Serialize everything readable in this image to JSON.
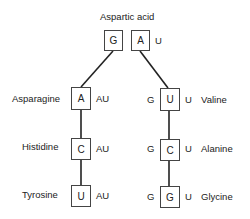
{
  "title": "Aspartic acid",
  "root": {
    "boxes": [
      "G",
      "A"
    ],
    "suffix": "U"
  },
  "left_branch": [
    {
      "name": "Asparagine",
      "box": "A",
      "suffix": "AU"
    },
    {
      "name": "Histidine",
      "box": "C",
      "suffix": "AU"
    },
    {
      "name": "Tyrosine",
      "box": "U",
      "suffix": "AU"
    }
  ],
  "right_branch": [
    {
      "name": "Valine",
      "prefix": "G",
      "box": "U",
      "suffix": "U"
    },
    {
      "name": "Alanine",
      "prefix": "G",
      "box": "C",
      "suffix": "U"
    },
    {
      "name": "Glycine",
      "prefix": "G",
      "box": "G",
      "suffix": "U"
    }
  ]
}
